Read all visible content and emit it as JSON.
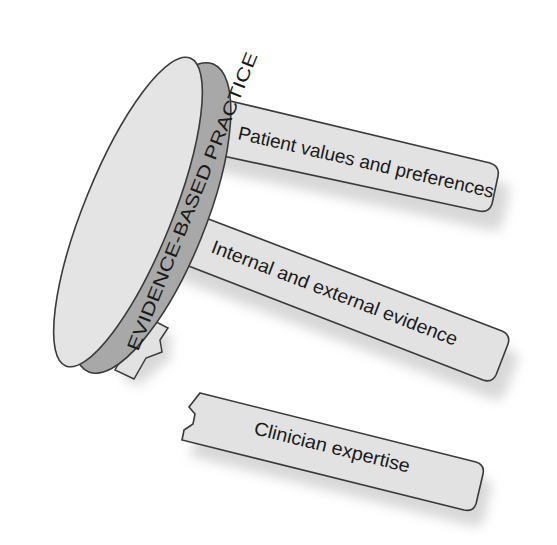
{
  "diagram": {
    "title": "EVIDENCE-BASED PRACTICE",
    "legs": [
      {
        "label": "Patient values and preferences",
        "state": "attached"
      },
      {
        "label": "Internal and external evidence",
        "state": "attached"
      },
      {
        "label": "Clinician expertise",
        "state": "broken"
      }
    ],
    "colors": {
      "tabletop_face": "#e4e4e4",
      "tabletop_edge": "#a8a8a8",
      "leg_fill": "#e2e2e2",
      "outline": "#3a3a3a",
      "shadow": "#b0b0b0"
    }
  }
}
